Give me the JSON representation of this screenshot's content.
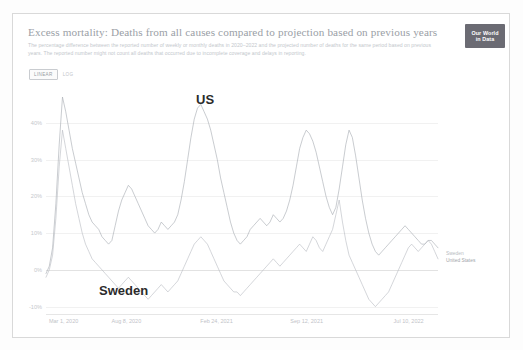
{
  "header": {
    "title": "Excess mortality: Deaths from all causes compared to projection based on previous years",
    "subtitle": "The percentage difference between the reported number of weekly or monthly deaths in 2020–2022 and the projected number of deaths for the same period based on previous years. The reported number might not count all deaths that occurred due to incomplete coverage and delays in reporting.",
    "logo_line1": "Our World",
    "logo_line2": "in Data"
  },
  "controls": {
    "linear_label": "LINEAR",
    "log_label": "LOG",
    "active": "LINEAR"
  },
  "annotations": {
    "us": "US",
    "sweden": "Sweden"
  },
  "legend": {
    "items": [
      {
        "label": "Sweden",
        "color": "#b8bcc2"
      },
      {
        "label": "United States",
        "color": "#9fa4aa"
      }
    ]
  },
  "chart_data": {
    "type": "line",
    "title": "Excess mortality: Deaths from all causes compared to projection based on previous years",
    "xlabel": "",
    "ylabel": "",
    "grid": true,
    "legend_position": "right",
    "ylim": [
      -12,
      50
    ],
    "ytick_labels": [
      "40%",
      "30%",
      "20%",
      "10%",
      "0%",
      "-10%"
    ],
    "ytick_values": [
      40,
      30,
      20,
      10,
      0,
      -10
    ],
    "xtick_labels": [
      "Mar 1, 2020",
      "Aug 8, 2020",
      "Feb 24, 2021",
      "Sep 12, 2021",
      "Jul 10, 2022"
    ],
    "xtick_positions": [
      0.045,
      0.205,
      0.435,
      0.665,
      0.925
    ],
    "series": [
      {
        "name": "United States",
        "color": "#a8acb2",
        "values": [
          -1,
          1,
          6,
          18,
          34,
          47,
          43,
          38,
          33,
          29,
          25,
          21,
          18,
          15,
          13,
          12,
          11,
          9,
          8,
          7,
          8,
          12,
          16,
          19,
          21,
          23,
          22,
          20,
          18,
          16,
          14,
          12,
          11,
          10,
          11,
          13,
          12,
          11,
          12,
          13,
          15,
          19,
          24,
          30,
          36,
          41,
          44,
          45,
          43,
          41,
          38,
          34,
          30,
          25,
          21,
          17,
          13,
          10,
          8,
          7,
          8,
          9,
          11,
          12,
          13,
          14,
          13,
          12,
          13,
          15,
          14,
          13,
          14,
          16,
          19,
          23,
          28,
          33,
          36,
          38,
          37,
          35,
          32,
          28,
          24,
          20,
          17,
          15,
          17,
          22,
          28,
          34,
          38,
          36,
          31,
          25,
          19,
          14,
          10,
          7,
          5,
          4,
          5,
          6,
          7,
          8,
          9,
          10,
          11,
          12,
          11,
          10,
          9,
          8,
          7,
          7,
          8,
          8,
          7,
          6
        ]
      },
      {
        "name": "Sweden",
        "color": "#b9bdc3",
        "values": [
          -2,
          0,
          4,
          14,
          28,
          38,
          33,
          28,
          23,
          18,
          14,
          10,
          7,
          5,
          3,
          2,
          1,
          0,
          -1,
          -2,
          -3,
          -4,
          -5,
          -4,
          -3,
          -2,
          -3,
          -4,
          -5,
          -6,
          -7,
          -8,
          -7,
          -6,
          -5,
          -4,
          -5,
          -6,
          -5,
          -4,
          -3,
          -1,
          1,
          3,
          5,
          7,
          8,
          9,
          8,
          7,
          5,
          3,
          1,
          -1,
          -3,
          -4,
          -5,
          -6,
          -6,
          -7,
          -6,
          -5,
          -4,
          -3,
          -2,
          -1,
          0,
          1,
          2,
          3,
          2,
          1,
          2,
          3,
          4,
          5,
          6,
          7,
          6,
          5,
          7,
          9,
          8,
          6,
          5,
          7,
          9,
          11,
          15,
          19,
          13,
          8,
          4,
          2,
          0,
          -2,
          -4,
          -6,
          -8,
          -9,
          -10,
          -9,
          -8,
          -7,
          -6,
          -4,
          -2,
          0,
          2,
          4,
          6,
          7,
          6,
          5,
          6,
          7,
          8,
          7,
          5,
          3
        ]
      }
    ]
  }
}
